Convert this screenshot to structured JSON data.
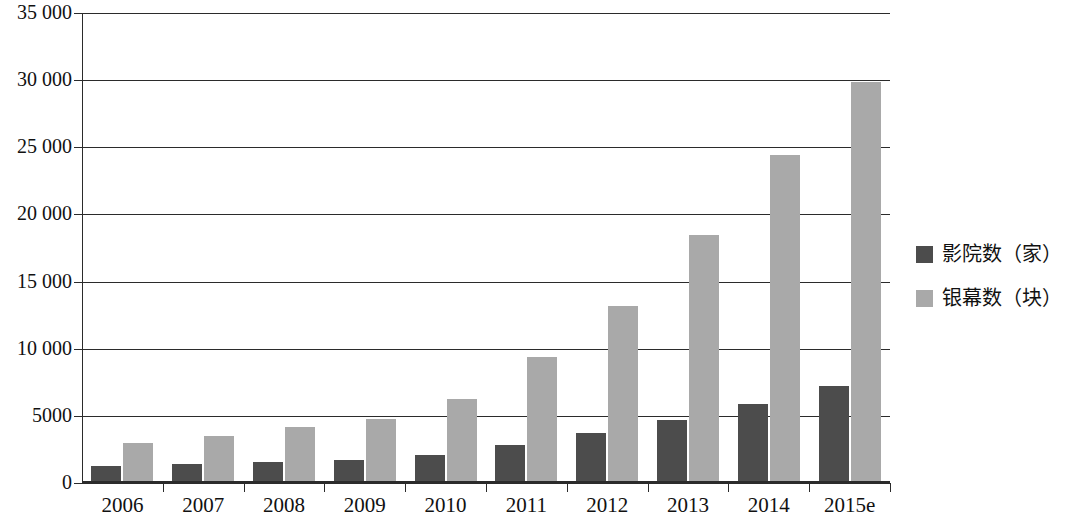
{
  "chart_data": {
    "type": "bar",
    "title": "",
    "subtitle": "",
    "xlabel": "",
    "ylabel": "",
    "categories": [
      "2006",
      "2007",
      "2008",
      "2009",
      "2010",
      "2011",
      "2012",
      "2013",
      "2014",
      "2015e"
    ],
    "series": [
      {
        "name": "影院数（家）",
        "color": "#4c4c4c",
        "values": [
          1300,
          1400,
          1550,
          1700,
          2100,
          2800,
          3700,
          4700,
          5850,
          7200
        ]
      },
      {
        "name": "银幕数（块）",
        "color": "#a9a9a9",
        "values": [
          3000,
          3500,
          4150,
          4750,
          6250,
          9400,
          13200,
          18500,
          24400,
          29900
        ]
      }
    ],
    "ylim": [
      0,
      35000
    ],
    "yticks": [
      0,
      5000,
      10000,
      15000,
      20000,
      25000,
      30000,
      35000
    ],
    "ytick_labels": [
      "0",
      "5000",
      "10 000",
      "15 000",
      "20 000",
      "25 000",
      "30 000",
      "35 000"
    ],
    "grid": true,
    "grid_axis": "y",
    "legend_position": "right"
  },
  "legend": {
    "items": [
      {
        "label": "影院数（家）",
        "color": "#4c4c4c"
      },
      {
        "label": "银幕数（块）",
        "color": "#a9a9a9"
      }
    ]
  }
}
